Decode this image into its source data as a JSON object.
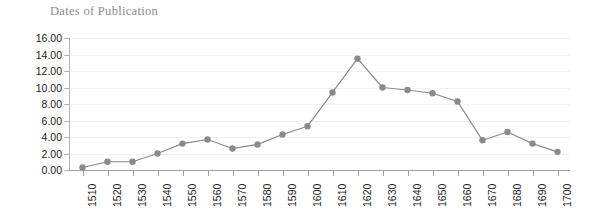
{
  "chart_data": {
    "type": "line",
    "title": "Dates of Publication",
    "xlabel": "",
    "ylabel": "",
    "categories": [
      "1510",
      "1520",
      "1530",
      "1540",
      "1550",
      "1560",
      "1570",
      "1580",
      "1590",
      "1600",
      "1610",
      "1620",
      "1630",
      "1640",
      "1650",
      "1660",
      "1670",
      "1680",
      "1690",
      "1700"
    ],
    "values": [
      0.3,
      1.0,
      1.0,
      2.0,
      3.2,
      3.7,
      2.6,
      3.1,
      4.3,
      5.3,
      9.4,
      13.5,
      10.0,
      9.7,
      9.3,
      8.3,
      3.6,
      4.6,
      3.2,
      2.2
    ],
    "ylim": [
      0,
      16
    ],
    "ytick_labels": [
      "16.00",
      "14.00",
      "12.00",
      "10.00",
      "8.00",
      "6.00",
      "4.00",
      "2.00",
      "0.00"
    ],
    "ytick_values": [
      16,
      14,
      12,
      10,
      8,
      6,
      4,
      2,
      0
    ],
    "grid": true,
    "legend": "none",
    "series_color": "#8a8a8a",
    "marker_color": "#8a8a8a",
    "gridline_color": "#f1f1f1",
    "axis_color": "#9e9e9e",
    "title_color": "#8c8c8c",
    "tick_label_color": "#1c1c1c",
    "background_color": "#ffffff"
  }
}
